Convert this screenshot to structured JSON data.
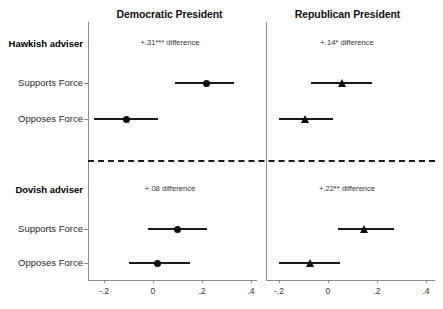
{
  "figure": {
    "panels": [
      {
        "key": "democratic",
        "title": "Democratic President",
        "marker": "circle"
      },
      {
        "key": "republican",
        "title": "Republican President",
        "marker": "triangle"
      }
    ],
    "groups": [
      {
        "key": "hawkish",
        "label": "Hawkish adviser"
      },
      {
        "key": "dovish",
        "label": "Dovish adviser"
      }
    ],
    "row_labels": {
      "supports": "Supports Force",
      "opposes": "Opposes Force"
    },
    "annotations": {
      "hawkish_democratic": "+.31*** difference",
      "hawkish_republican": "+.14* difference",
      "dovish_democratic": "+.08 difference",
      "dovish_republican": "+.22** difference"
    },
    "axis": {
      "ticks": [
        "-.2",
        "0",
        ".2",
        ".4"
      ],
      "tick_values": [
        -0.2,
        0,
        0.2,
        0.4
      ],
      "xlim": [
        -0.28,
        0.44
      ]
    },
    "colors": {
      "marker": "#0d0d0d",
      "axis": "#8c8c8c",
      "text": "#1a1a1a",
      "separator": "#1a1a1a"
    }
  },
  "chart_data": {
    "type": "scatter",
    "title": "",
    "subtitle": "",
    "xlabel": "",
    "ylabel": "",
    "xlim": [
      -0.28,
      0.44
    ],
    "grid": false,
    "legend": "none",
    "axis_ticks": [
      -0.2,
      0,
      0.2,
      0.4
    ],
    "axis_tick_labels": [
      "-.2",
      "0",
      ".2",
      ".4"
    ],
    "panels": [
      {
        "name": "Democratic President",
        "marker": "circle",
        "groups": [
          {
            "name": "Hawkish adviser",
            "annotation": "+.31*** difference",
            "difference": 0.31,
            "significance": "***",
            "points": [
              {
                "label": "Supports Force",
                "estimate": 0.22,
                "ci_low": 0.09,
                "ci_high": 0.33
              },
              {
                "label": "Opposes Force",
                "estimate": -0.11,
                "ci_low": -0.24,
                "ci_high": 0.02
              }
            ]
          },
          {
            "name": "Dovish adviser",
            "annotation": "+.08 difference",
            "difference": 0.08,
            "significance": "",
            "points": [
              {
                "label": "Supports Force",
                "estimate": 0.1,
                "ci_low": -0.02,
                "ci_high": 0.22
              },
              {
                "label": "Opposes Force",
                "estimate": 0.02,
                "ci_low": -0.1,
                "ci_high": 0.15
              }
            ]
          }
        ]
      },
      {
        "name": "Republican President",
        "marker": "triangle",
        "groups": [
          {
            "name": "Hawkish adviser",
            "annotation": "+.14* difference",
            "difference": 0.14,
            "significance": "*",
            "points": [
              {
                "label": "Supports Force",
                "estimate": 0.06,
                "ci_low": -0.07,
                "ci_high": 0.18
              },
              {
                "label": "Opposes Force",
                "estimate": -0.09,
                "ci_low": -0.2,
                "ci_high": 0.02
              }
            ]
          },
          {
            "name": "Dovish adviser",
            "annotation": "+.22** difference",
            "difference": 0.22,
            "significance": "**",
            "points": [
              {
                "label": "Supports Force",
                "estimate": 0.15,
                "ci_low": 0.04,
                "ci_high": 0.27
              },
              {
                "label": "Opposes Force",
                "estimate": -0.07,
                "ci_low": -0.2,
                "ci_high": 0.05
              }
            ]
          }
        ]
      }
    ]
  }
}
